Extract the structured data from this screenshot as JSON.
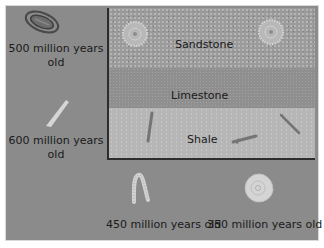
{
  "diagram": {
    "layers": [
      {
        "name": "Sandstone",
        "label": "Sandstone",
        "color": "#9b9b9b"
      },
      {
        "name": "Limestone",
        "label": "Limestone",
        "color": "#8f8f8f"
      },
      {
        "name": "Shale",
        "label": "Shale",
        "color": "#b6b6b6"
      }
    ],
    "fossils": [
      {
        "icon": "trilobite-icon",
        "age_line1": "500 million years",
        "age_line2": "old"
      },
      {
        "icon": "rod-fossil-icon",
        "age_line1": "600 million years",
        "age_line2": "old"
      },
      {
        "icon": "worm-fossil-icon",
        "age": "450 million years old"
      },
      {
        "icon": "ammonite-icon",
        "age": "350 million years old"
      }
    ],
    "colors": {
      "background": "#8b8b8b",
      "border": "#2d2d2d",
      "text": "#1a1a1a",
      "fossil_light": "#d8d8d8"
    }
  }
}
